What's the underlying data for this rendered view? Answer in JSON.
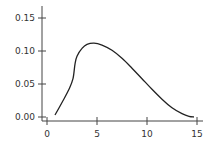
{
  "chart_data": {
    "type": "line",
    "title": "",
    "xlabel": "",
    "ylabel": "",
    "xlim": [
      -0.5,
      15.5
    ],
    "ylim": [
      0.0,
      0.16
    ],
    "grid": false,
    "legend": null,
    "x_ticks": [
      "0",
      "5",
      "10",
      "15"
    ],
    "y_ticks": [
      "0.00",
      "0.05",
      "0.10",
      "0.15"
    ],
    "series": [
      {
        "name": "curve",
        "color": "#222222",
        "x": [
          0.8,
          1.5,
          2.2,
          2.6,
          2.8,
          3.0,
          3.5,
          4.0,
          4.7,
          5.5,
          6.5,
          7.5,
          8.5,
          9.5,
          10.5,
          11.5,
          12.5,
          13.5,
          14.2,
          14.7
        ],
        "y": [
          0.003,
          0.022,
          0.042,
          0.058,
          0.08,
          0.092,
          0.104,
          0.11,
          0.112,
          0.109,
          0.101,
          0.089,
          0.074,
          0.058,
          0.042,
          0.027,
          0.014,
          0.005,
          0.001,
          0.0
        ]
      }
    ]
  }
}
